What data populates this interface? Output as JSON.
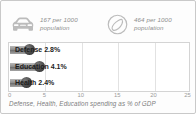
{
  "panel": {
    "border_color": "#c9c9c9",
    "background": "#fdfdfd"
  },
  "stats": [
    {
      "icon": "car-icon",
      "value": "167",
      "text": "167 per 1000\npopulation"
    },
    {
      "icon": "phone-dial-icon",
      "value": "464",
      "text": "464 per 1000\npopulation"
    }
  ],
  "chart_data": {
    "type": "bar",
    "orientation": "horizontal",
    "title": "",
    "caption": "Defense, Health, Education spending as % of GDP",
    "categories": [
      "Defense",
      "Education",
      "Health"
    ],
    "values": [
      2.8,
      4.1,
      2.4
    ],
    "labels": [
      "Defense 2.8%",
      "Education 4.1%",
      "Health 2.4%"
    ],
    "value_labels": [
      "2.8%",
      "4.1%",
      "2.4%"
    ],
    "xlabel": "",
    "ylabel": "",
    "xlim": [
      0,
      25
    ],
    "xticks": [
      0,
      5,
      10,
      15,
      20,
      25
    ],
    "xtick_labels": [
      "0",
      "5",
      "10",
      "15",
      "20",
      "25"
    ],
    "grid": true,
    "grid_axis": "x",
    "legend": "none",
    "bar_color": "#8e8e8e",
    "marker_color": "#3a3a3a"
  }
}
